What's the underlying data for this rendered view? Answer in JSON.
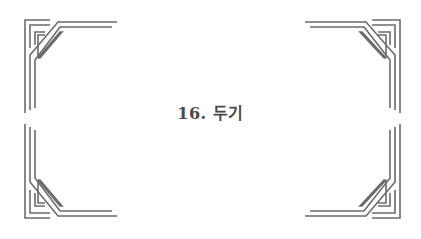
{
  "title": "16. 두기",
  "colors": {
    "line": "#6b6b6b",
    "text": "#4a4a4a",
    "background": "#ffffff"
  }
}
